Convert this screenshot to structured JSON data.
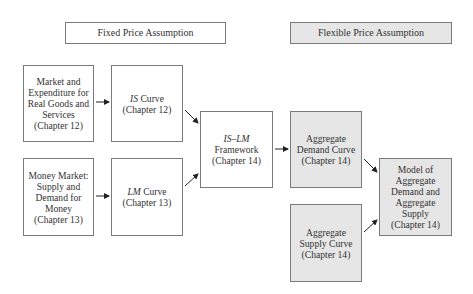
{
  "headers": {
    "fixed": "Fixed Price Assumption",
    "flexible": "Flexible Price Assumption"
  },
  "nodes": {
    "goods_market": {
      "lines": [
        "Market and",
        "Expenditure for",
        "Real Goods and",
        "Services",
        "(Chapter 12)"
      ]
    },
    "is_curve": {
      "italic": "IS",
      "title_rest": " Curve",
      "chapter": "(Chapter 12)"
    },
    "money_market": {
      "lines": [
        "Money Market:",
        "Supply and",
        "Demand for",
        "Money",
        "(Chapter 13)"
      ]
    },
    "lm_curve": {
      "italic": "LM",
      "title_rest": " Curve",
      "chapter": "(Chapter 13)"
    },
    "is_lm": {
      "italic": "IS–LM",
      "lines": [
        "Framework",
        "(Chapter 14)"
      ]
    },
    "aggregate_demand": {
      "lines": [
        "Aggregate",
        "Demand Curve",
        "(Chapter 14)"
      ]
    },
    "aggregate_supply": {
      "lines": [
        "Aggregate",
        "Supply Curve",
        "(Chapter 14)"
      ]
    },
    "ad_as_model": {
      "lines": [
        "Model of",
        "Aggregate",
        "Demand and",
        "Aggregate",
        "Supply",
        "(Chapter 14)"
      ]
    }
  },
  "edges": [
    {
      "from": "goods_market",
      "to": "is_curve"
    },
    {
      "from": "money_market",
      "to": "lm_curve"
    },
    {
      "from": "is_curve",
      "to": "is_lm"
    },
    {
      "from": "lm_curve",
      "to": "is_lm"
    },
    {
      "from": "is_lm",
      "to": "aggregate_demand"
    },
    {
      "from": "aggregate_demand",
      "to": "ad_as_model"
    },
    {
      "from": "aggregate_supply",
      "to": "ad_as_model"
    }
  ],
  "colors": {
    "border": "#7a7a7a",
    "shaded_fill": "#e6e6e6",
    "text": "#333333",
    "arrow": "#222222"
  }
}
